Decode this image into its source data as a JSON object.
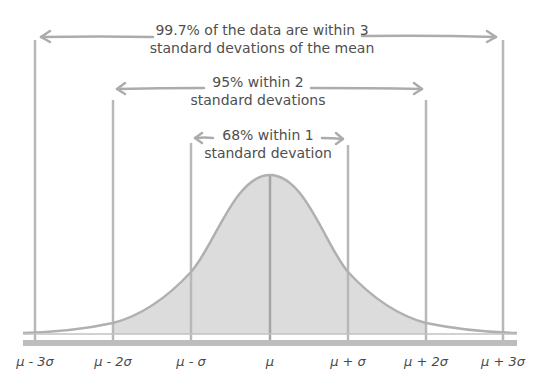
{
  "diagram": {
    "annotations": [
      {
        "id": "three_sigma",
        "line1": "99.7% of the data are within 3",
        "line2": "standard devations of the mean"
      },
      {
        "id": "two_sigma",
        "line1": "95% within 2",
        "line2": "standard devations"
      },
      {
        "id": "one_sigma",
        "line1": "68% within 1",
        "line2": "standard devation"
      }
    ],
    "axis_labels": [
      "μ - 3σ",
      "μ - 2σ",
      "μ - σ",
      "μ",
      "μ + σ",
      "μ + 2σ",
      "μ + 3σ"
    ],
    "colors": {
      "fill": "#dcdcdc",
      "line": "#b3b3b3",
      "arrow": "#acacac",
      "center_line": "#a6a6a6",
      "text": "#4f4f4f"
    }
  }
}
